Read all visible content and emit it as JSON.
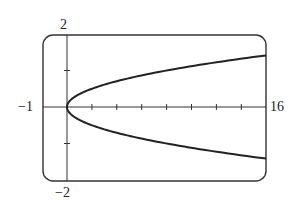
{
  "chart_data": {
    "type": "line",
    "title": "",
    "xlabel": "",
    "ylabel": "",
    "xlim": [
      -1,
      16
    ],
    "ylim": [
      -2,
      2
    ],
    "grid": false,
    "legend": null,
    "window_labels": {
      "xmin": "−1",
      "xmax": "16",
      "ymin": "−2",
      "ymax": "2"
    },
    "x_ticks": [
      2,
      4,
      6,
      8,
      10,
      12,
      14
    ],
    "y_ticks": [
      -1,
      1
    ],
    "series": [
      {
        "name": "upper branch",
        "equation": "x = 8y^2, y >= 0",
        "x": [
          0,
          0.5,
          1,
          2,
          4,
          6,
          8,
          10,
          12,
          14,
          16
        ],
        "y": [
          0,
          0.25,
          0.354,
          0.5,
          0.707,
          0.866,
          1.0,
          1.118,
          1.225,
          1.323,
          1.414
        ]
      },
      {
        "name": "lower branch",
        "equation": "x = 8y^2, y <= 0",
        "x": [
          0,
          0.5,
          1,
          2,
          4,
          6,
          8,
          10,
          12,
          14,
          16
        ],
        "y": [
          0,
          -0.25,
          -0.354,
          -0.5,
          -0.707,
          -0.866,
          -1.0,
          -1.118,
          -1.225,
          -1.323,
          -1.414
        ]
      }
    ]
  },
  "style": {
    "curve_color": "#222222",
    "frame_color": "#333333",
    "axis_color": "#333333"
  }
}
